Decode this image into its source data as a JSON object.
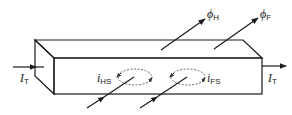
{
  "diagram": {
    "labels": {
      "it_left": {
        "symbol": "I",
        "sub": "T"
      },
      "it_right": {
        "symbol": "I",
        "sub": "T"
      },
      "ihs": {
        "symbol": "i",
        "sub": "HS"
      },
      "ifs": {
        "symbol": "i",
        "sub": "FS"
      },
      "phi_h": {
        "symbol": "ϕ",
        "sub": "H"
      },
      "phi_f": {
        "symbol": "ϕ",
        "sub": "F"
      }
    },
    "colors": {
      "stroke": "#1a1a1a",
      "dashed_loop": "#555555",
      "background": "#ffffff"
    }
  }
}
